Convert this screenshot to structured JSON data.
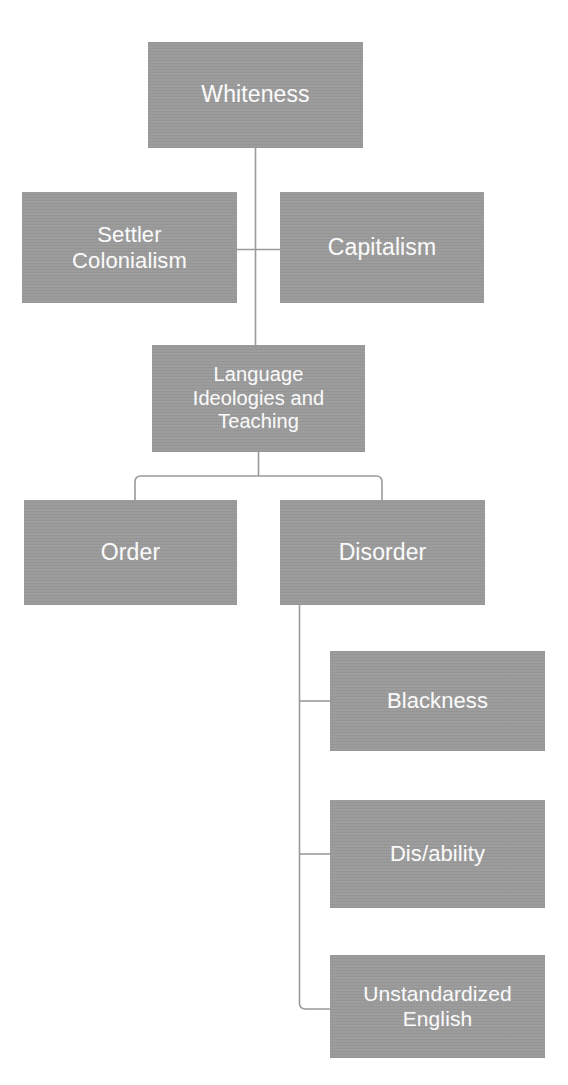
{
  "diagram": {
    "style": {
      "node_fill": "#9a9a9a",
      "node_text_color": "#ffffff",
      "connector_color": "#9a9a9a",
      "background": "#ffffff"
    },
    "nodes": [
      {
        "id": "whiteness",
        "label": "Whiteness",
        "level": 1
      },
      {
        "id": "settler",
        "label": "Settler\nColonialism",
        "level": 2
      },
      {
        "id": "capitalism",
        "label": "Capitalism",
        "level": 2
      },
      {
        "id": "language",
        "label": "Language\nIdeologies and\nTeaching",
        "level": 3
      },
      {
        "id": "order",
        "label": "Order",
        "level": 4
      },
      {
        "id": "disorder",
        "label": "Disorder",
        "level": 4
      },
      {
        "id": "blackness",
        "label": "Blackness",
        "level": 5
      },
      {
        "id": "disability",
        "label": "Dis/ability",
        "level": 5
      },
      {
        "id": "unstandardized",
        "label": "Unstandardized\nEnglish",
        "level": 5
      }
    ],
    "edges": [
      {
        "from": "whiteness",
        "to": "language",
        "kind": "vertical-trunk"
      },
      {
        "from": "settler",
        "to": "trunk",
        "kind": "horizontal-stub"
      },
      {
        "from": "capitalism",
        "to": "trunk",
        "kind": "horizontal-stub"
      },
      {
        "from": "language",
        "to": "order",
        "kind": "elbow-branch"
      },
      {
        "from": "language",
        "to": "disorder",
        "kind": "elbow-branch"
      },
      {
        "from": "disorder",
        "to": "blackness",
        "kind": "elbow-branch"
      },
      {
        "from": "disorder",
        "to": "disability",
        "kind": "elbow-branch"
      },
      {
        "from": "disorder",
        "to": "unstandardized",
        "kind": "elbow-branch"
      }
    ]
  }
}
